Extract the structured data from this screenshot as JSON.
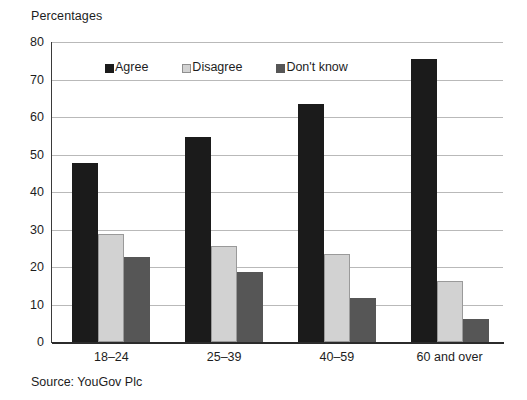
{
  "axis_title": "Percentages",
  "source_note": "Source: YouGov Plc",
  "legend": {
    "items": [
      {
        "label": "Agree",
        "icon": "square-swatch-black",
        "color": "#1b1b1b"
      },
      {
        "label": "Disagree",
        "icon": "square-swatch-light-gray",
        "color": "#d2d2d2"
      },
      {
        "label": "Don't know",
        "icon": "square-swatch-dark-gray",
        "color": "#565656"
      }
    ]
  },
  "chart_data": {
    "type": "bar",
    "title": "",
    "subtitle": "",
    "xlabel": "",
    "ylabel": "Percentages",
    "ylim": [
      0,
      80
    ],
    "yticks": [
      0,
      10,
      20,
      30,
      40,
      50,
      60,
      70,
      80
    ],
    "ytick_labels": [
      "0",
      "10",
      "20",
      "30",
      "40",
      "50",
      "60",
      "70",
      "80"
    ],
    "grid": true,
    "grid_axis": "y",
    "legend_position": "top-left-inside",
    "categories": [
      "18–24",
      "25–39",
      "40–59",
      "60 and over"
    ],
    "series": [
      {
        "name": "Agree",
        "color": "#1b1b1b",
        "values": [
          47.8,
          54.7,
          63.4,
          75.6
        ]
      },
      {
        "name": "Disagree",
        "color": "#d2d2d2",
        "values": [
          28.8,
          25.7,
          23.6,
          16.3
        ]
      },
      {
        "name": "Don't know",
        "color": "#565656",
        "values": [
          22.8,
          18.8,
          11.7,
          6.2
        ]
      }
    ],
    "annotations": [
      "Source: YouGov Plc"
    ]
  }
}
